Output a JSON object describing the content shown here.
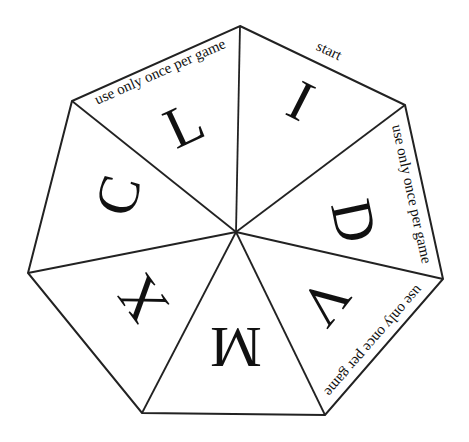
{
  "board": {
    "shape": "heptagon",
    "stroke_color": "#222222",
    "fill_color": "#ffffff",
    "center": [
      236,
      232
    ],
    "vertices": [
      [
        240,
        26
      ],
      [
        405,
        105
      ],
      [
        443,
        279
      ],
      [
        325,
        415
      ],
      [
        142,
        413
      ],
      [
        28,
        273
      ],
      [
        72,
        101
      ]
    ]
  },
  "sectors": [
    {
      "letter": "I",
      "edge_label": "start"
    },
    {
      "letter": "D",
      "edge_label": "use only once per game"
    },
    {
      "letter": "V",
      "edge_label": "use only once per game"
    },
    {
      "letter": "M",
      "edge_label": ""
    },
    {
      "letter": "X",
      "edge_label": ""
    },
    {
      "letter": "C",
      "edge_label": ""
    },
    {
      "letter": "L",
      "edge_label": "use only once per game"
    }
  ]
}
